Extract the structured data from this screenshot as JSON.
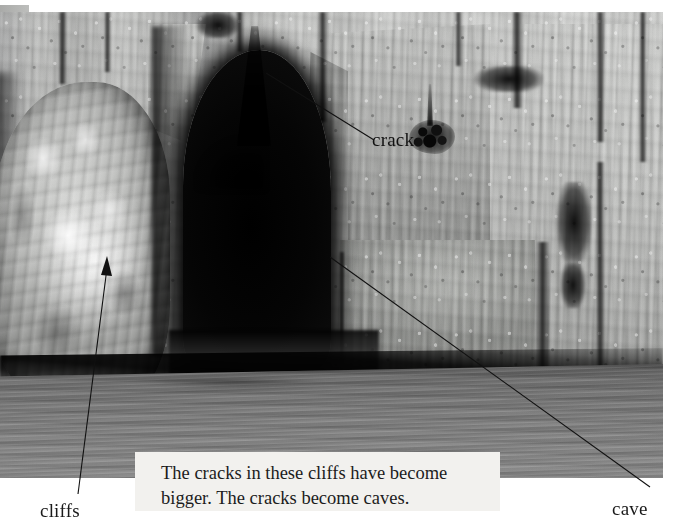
{
  "page": {
    "kind": "photograph-with-annotations",
    "width": 675,
    "height": 528,
    "background_color": "#ffffff"
  },
  "photo": {
    "description": "Black-and-white photograph of a limestone sea cliff with a large dark cave entrance at the waterline",
    "palette": {
      "rock_light": "#d2d3d1",
      "rock_mid": "#b4b5b3",
      "rock_dark": "#8d8e8c",
      "cave_black": "#000000",
      "water_gray": "#7d7d7d",
      "caption_paper": "#f2f1ee",
      "ink": "#1a1a1a"
    }
  },
  "annotations": {
    "items": [
      {
        "id": "crack",
        "label": "crack",
        "leader": "line",
        "target": "thin dark fissure in upper rock face"
      },
      {
        "id": "cliffs",
        "label": "cliffs",
        "leader": "arrow",
        "target": "bright rock mass on the left"
      },
      {
        "id": "cave",
        "label": "cave",
        "leader": "line",
        "target": "dark opening at the waterline"
      }
    ],
    "line_color": "#111111"
  },
  "caption": {
    "line1": "The cracks in these cliffs have become",
    "line2": "bigger. The cracks become caves.",
    "background_color": "#f2f1ee"
  }
}
